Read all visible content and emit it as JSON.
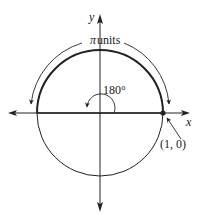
{
  "diagram": {
    "type": "unit-circle-angle",
    "axis_labels": {
      "x": "x",
      "y": "y"
    },
    "arc_length_label": "π units",
    "arc_length_symbol": "π",
    "arc_length_word": "units",
    "angle_label": "180°",
    "angle_degrees": 180,
    "point_label": "(1, 0)",
    "point": {
      "x": 1,
      "y": 0
    },
    "colors": {
      "stroke": "#222222",
      "background": "#ffffff"
    }
  }
}
